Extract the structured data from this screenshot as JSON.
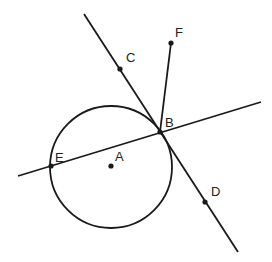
{
  "diagram": {
    "type": "geometry",
    "stroke_color": "#1a1a1a",
    "circle": {
      "name": "circle-A",
      "center": "A",
      "cx": 111,
      "cy": 167,
      "r": 61
    },
    "points": [
      {
        "name": "A",
        "label": "A",
        "x": 111,
        "y": 166,
        "lx": 115,
        "ly": 161
      },
      {
        "name": "B",
        "label": "B",
        "x": 160,
        "y": 132,
        "lx": 165,
        "ly": 127
      },
      {
        "name": "C",
        "label": "C",
        "x": 120,
        "y": 69,
        "lx": 126,
        "ly": 62
      },
      {
        "name": "D",
        "label": "D",
        "x": 205,
        "y": 202,
        "lx": 211,
        "ly": 196
      },
      {
        "name": "E",
        "label": "E",
        "x": 51,
        "y": 166,
        "lx": 55,
        "ly": 162
      },
      {
        "name": "F",
        "label": "F",
        "x": 171,
        "y": 43,
        "lx": 175,
        "ly": 37
      }
    ],
    "lines": [
      {
        "name": "tangent-line-CD",
        "x1": 84,
        "y1": 14,
        "x2": 238,
        "y2": 252
      },
      {
        "name": "secant-line-EB",
        "x1": 18,
        "y1": 176,
        "x2": 261,
        "y2": 102
      },
      {
        "name": "segment-BF",
        "x1": 160,
        "y1": 132,
        "x2": 171,
        "y2": 43
      }
    ]
  }
}
